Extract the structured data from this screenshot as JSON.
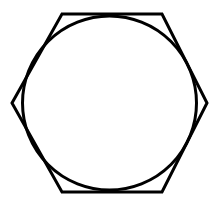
{
  "figure": {
    "title": "Hexagon with inscribed circle",
    "background_color": "#ffffff",
    "stroke_color": "#000000",
    "canvas": {
      "width": 218,
      "height": 205
    },
    "shapes": [
      {
        "id": "hexagon",
        "name": "hexagon",
        "type": "polygon",
        "sides": 6,
        "orientation": "flat-top",
        "stroke_color": "#000000",
        "stroke_width": 3,
        "fill": "none",
        "center": {
          "x": 109.5,
          "y": 103
        },
        "circumradius": 97,
        "points": "62,14 162,14 207,103 162,192 62,192 12,103",
        "vertices": [
          {
            "x": 62,
            "y": 14
          },
          {
            "x": 162,
            "y": 14
          },
          {
            "x": 207,
            "y": 103
          },
          {
            "x": 162,
            "y": 192
          },
          {
            "x": 62,
            "y": 192
          },
          {
            "x": 12,
            "y": 103
          }
        ]
      },
      {
        "id": "circle",
        "name": "circle",
        "type": "circle",
        "stroke_color": "#000000",
        "stroke_width": 3,
        "fill": "none",
        "center": {
          "x": 109.5,
          "y": 103
        },
        "radius": 87,
        "cx": 109.5,
        "cy": 103,
        "r": 87
      }
    ]
  }
}
